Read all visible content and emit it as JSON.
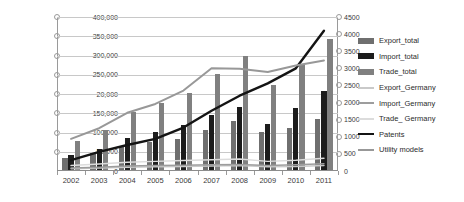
{
  "chart_data": {
    "type": "bar",
    "title": "",
    "subtitle": "",
    "xlabel": "",
    "ylabel": "",
    "categories": [
      "2002",
      "2003",
      "2004",
      "2005",
      "2006",
      "2007",
      "2008",
      "2009",
      "2010",
      "2011"
    ],
    "grid": true,
    "legend_position": "right",
    "axes": {
      "left": {
        "min": 0,
        "max": 400000,
        "step": 50000,
        "tick_labels": [
          "400,000",
          "350,000",
          "300,000",
          "250,000",
          "20,000",
          "150,000",
          "100,000",
          "50,000",
          "0"
        ],
        "tick_values": [
          400000,
          350000,
          300000,
          250000,
          200000,
          150000,
          100000,
          50000,
          0
        ],
        "note_visible_typo": "20,000"
      },
      "right": {
        "min": 0,
        "max": 4500,
        "step": 500,
        "tick_labels": [
          "4500",
          "4000",
          "3500",
          "3000",
          "2500",
          "2000",
          "1500",
          "1000",
          "500",
          "0"
        ],
        "tick_values": [
          4500,
          4000,
          3500,
          3000,
          2500,
          2000,
          1500,
          1000,
          500,
          0
        ]
      }
    },
    "series": [
      {
        "name": "Export_total",
        "kind": "bar",
        "axis": "left",
        "color": "#6f6f6f",
        "values": [
          35000,
          48000,
          66000,
          76000,
          84000,
          106000,
          131000,
          102000,
          113000,
          135000
        ]
      },
      {
        "name": "Import_total",
        "kind": "bar",
        "axis": "left",
        "color": "#1c1c1c",
        "values": [
          42000,
          58000,
          87000,
          101000,
          119000,
          145000,
          167000,
          122000,
          164000,
          207000
        ]
      },
      {
        "name": "Trade_total",
        "kind": "bar",
        "axis": "left",
        "color": "#808080",
        "values": [
          77000,
          106000,
          152000,
          177000,
          203000,
          252000,
          300000,
          224000,
          277000,
          343000
        ]
      },
      {
        "name": "Export_Germany",
        "kind": "line",
        "axis": "left",
        "color": "#c9c9c9",
        "values": [
          6000,
          8000,
          10000,
          11000,
          12000,
          13000,
          14000,
          11000,
          12000,
          14000
        ]
      },
      {
        "name": "Import_Germany",
        "kind": "line",
        "axis": "left",
        "color": "#9d9d9d",
        "values": [
          8000,
          10000,
          13000,
          14000,
          15000,
          16000,
          17000,
          14000,
          16000,
          19000
        ]
      },
      {
        "name": "Trade_ Germany",
        "kind": "line",
        "axis": "left",
        "color": "#dcdcdc",
        "values": [
          14000,
          18000,
          23000,
          25000,
          27000,
          29000,
          31000,
          25000,
          28000,
          33000
        ]
      },
      {
        "name": "Patents",
        "kind": "line",
        "axis": "right",
        "color": "#141414",
        "values": [
          320,
          560,
          760,
          940,
          1270,
          1760,
          2200,
          2560,
          3000,
          4100
        ]
      },
      {
        "name": "Utility models",
        "kind": "line",
        "axis": "right",
        "color": "#989898",
        "values": [
          940,
          1250,
          1700,
          1960,
          2350,
          3000,
          2990,
          2890,
          3080,
          3230
        ]
      }
    ]
  },
  "legend": {
    "items": [
      {
        "label": "Export_total",
        "swatch": "block",
        "color": "#6f6f6f"
      },
      {
        "label": "Import_total",
        "swatch": "block",
        "color": "#1c1c1c"
      },
      {
        "label": "Trade_total",
        "swatch": "block",
        "color": "#808080"
      },
      {
        "label": "Export_Germany",
        "swatch": "line",
        "color": "#c9c9c9"
      },
      {
        "label": "Import_Germany",
        "swatch": "line",
        "color": "#9d9d9d"
      },
      {
        "label": "Trade_ Germany",
        "swatch": "line",
        "color": "#dcdcdc"
      },
      {
        "label": "Patents",
        "swatch": "line",
        "color": "#141414"
      },
      {
        "label": "Utility models",
        "swatch": "line",
        "color": "#989898"
      }
    ]
  }
}
